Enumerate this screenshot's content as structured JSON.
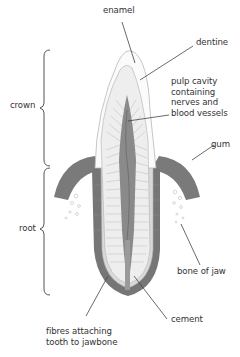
{
  "diagram": {
    "labels": {
      "enamel": "enamel",
      "dentine": "dentine",
      "pulp_cavity": [
        "pulp cavity",
        "containing",
        "nerves and",
        "blood vessels"
      ],
      "gum": "gum",
      "crown": "crown",
      "root": "root",
      "bone_of_jaw": "bone of jaw",
      "cement": "cement",
      "fibres": [
        "fibres attaching",
        "tooth to jawbone"
      ]
    },
    "colors": {
      "gum": "#6e6e6e",
      "pulp": "#8a8a8a",
      "dentine": "#ececec",
      "enamel": "#f7f7f7",
      "outline": "#b5b5b5",
      "leader_line": "#444444",
      "text": "#333333"
    }
  }
}
